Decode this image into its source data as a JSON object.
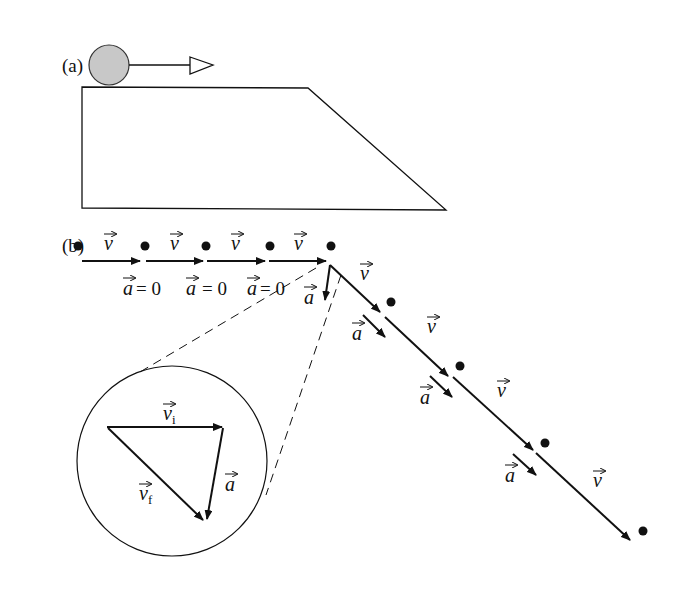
{
  "panels": {
    "a": {
      "label": "(a)"
    },
    "b": {
      "label": "(b)"
    }
  },
  "labels": {
    "v": "v",
    "a": "a",
    "a_zero": "a",
    "eq_zero": "= 0",
    "vi": "v",
    "vi_sub": "i",
    "vf": "v",
    "vf_sub": "f"
  },
  "colors": {
    "stroke": "#111111",
    "ball_fill": "#c8c8c8"
  }
}
